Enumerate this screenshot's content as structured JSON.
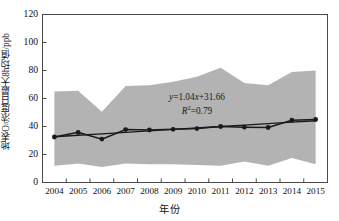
{
  "chart_data": {
    "type": "line",
    "title": "",
    "xlabel": "年份",
    "ylabel_prefix": "地表O",
    "ylabel_sub": "3",
    "ylabel_suffix": "浓度日最大8h均值/ppb",
    "ylabel_full": "地表O3浓度日最大8h均值/ppb",
    "categories": [
      2004,
      2005,
      2006,
      2007,
      2008,
      2009,
      2010,
      2011,
      2012,
      2013,
      2014,
      2015
    ],
    "xtick_labels": [
      "2004",
      "2005",
      "2006",
      "2007",
      "2008",
      "2009",
      "2010",
      "2011",
      "2012",
      "2013",
      "2014",
      "2015"
    ],
    "ytick_labels": [
      "0",
      "20",
      "40",
      "60",
      "80",
      "100",
      "120"
    ],
    "ytick_values": [
      0,
      20,
      40,
      60,
      80,
      100,
      120
    ],
    "ylim": [
      0,
      120
    ],
    "grid": false,
    "legend": "none",
    "series": [
      {
        "name": "地表O3浓度日最大8h均值",
        "marker": "filled-circle",
        "color": "#1a1a1a",
        "values": [
          32.5,
          35.8,
          31.0,
          37.8,
          37.5,
          38.0,
          38.5,
          40.0,
          39.5,
          39.3,
          44.5,
          45.0
        ]
      },
      {
        "name": "线性趋势线",
        "marker": "none",
        "color": "#1a1a1a",
        "values": [
          32.7,
          33.74,
          34.78,
          35.82,
          36.86,
          37.9,
          38.94,
          39.98,
          41.02,
          42.06,
          43.1,
          44.14
        ]
      }
    ],
    "band": {
      "name": "浓度范围带",
      "color": "#b3b3b3",
      "upper": [
        65.0,
        65.5,
        50.5,
        69.0,
        69.5,
        72.0,
        75.5,
        82.0,
        71.0,
        69.5,
        79.0,
        80.0
      ],
      "lower": [
        12.0,
        13.5,
        11.0,
        13.5,
        13.0,
        13.0,
        12.5,
        12.0,
        15.0,
        12.0,
        17.5,
        13.0
      ]
    },
    "annotations": [
      {
        "name": "regression-equation",
        "text": "y=1.04x+31.66",
        "x": 2009.2,
        "y": 59.5
      },
      {
        "name": "r-squared",
        "text": "R2=0.79",
        "x": 2009.2,
        "y": 51.5
      }
    ],
    "equation_parts": {
      "eq_y": "y",
      "eq_body": "=1.04",
      "eq_x": "x",
      "eq_tail": "+31.66",
      "r_symbol": "R",
      "r_exp": "2",
      "r_value": "=0.79"
    }
  }
}
